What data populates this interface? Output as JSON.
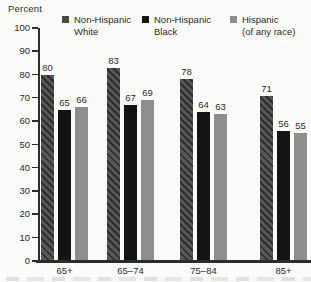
{
  "chart": {
    "axis_title": "Percent"
  },
  "legend": {
    "items": [
      {
        "label": "Non-Hispanic\nWhite",
        "color": "#4a4a4a"
      },
      {
        "label": "Non-Hispanic\nBlack",
        "color": "#141414"
      },
      {
        "label": "Hispanic\n(of any race)",
        "color": "#8e8e8e"
      }
    ]
  },
  "chart_data": {
    "type": "bar",
    "title": "",
    "xlabel": "",
    "ylabel": "Percent",
    "ylim": [
      0,
      100
    ],
    "yticks": [
      0,
      10,
      20,
      30,
      40,
      50,
      60,
      70,
      80,
      90,
      100
    ],
    "grid": false,
    "legend_position": "top",
    "value_labels": true,
    "categories": [
      "65+",
      "65–74",
      "75–84",
      "85+"
    ],
    "series": [
      {
        "name": "Non-Hispanic White",
        "color": "#4a4a4a",
        "hatch": "diagonal",
        "values": [
          80,
          83,
          78,
          71
        ]
      },
      {
        "name": "Non-Hispanic Black",
        "color": "#141414",
        "hatch": "none",
        "values": [
          65,
          67,
          64,
          56
        ]
      },
      {
        "name": "Hispanic (of any race)",
        "color": "#8e8e8e",
        "hatch": "none",
        "values": [
          66,
          69,
          63,
          55
        ]
      }
    ]
  }
}
